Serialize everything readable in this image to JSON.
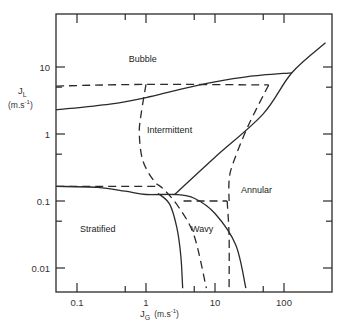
{
  "chart_data": {
    "type": "line",
    "title": "",
    "xlabel": "J_G (m.s^-1)",
    "ylabel": "J_L (m.s^-1)",
    "xscale": "log",
    "yscale": "log",
    "xlim": [
      0.05,
      400
    ],
    "ylim": [
      0.005,
      50
    ],
    "grid": false,
    "legend": null,
    "x_tick_labels": [
      "0.1",
      "1",
      "10",
      "100"
    ],
    "y_tick_labels": [
      "0.01",
      "0.1",
      "1",
      "10"
    ],
    "region_labels": [
      {
        "text": "Bubble",
        "x": 0.9,
        "y": 12
      },
      {
        "text": "Intermittent",
        "x": 2.2,
        "y": 1.05
      },
      {
        "text": "Annular",
        "x": 40,
        "y": 0.13
      },
      {
        "text": "Stratified",
        "x": 0.2,
        "y": 0.035
      },
      {
        "text": "Wavy",
        "x": 6.5,
        "y": 0.035
      }
    ],
    "series": [
      {
        "name": "solid: bubble/intermittent boundary",
        "style": "solid",
        "points": [
          [
            0.05,
            2.3
          ],
          [
            0.3,
            2.8
          ],
          [
            1,
            3.5
          ],
          [
            3,
            4.6
          ],
          [
            10,
            6.0
          ],
          [
            30,
            7.2
          ],
          [
            130,
            8.2
          ]
        ]
      },
      {
        "name": "solid: intermittent/annular boundary",
        "style": "solid",
        "points": [
          [
            2.6,
            0.125
          ],
          [
            10,
            0.45
          ],
          [
            50,
            2.0
          ],
          [
            130,
            8.2
          ],
          [
            400,
            23
          ]
        ]
      },
      {
        "name": "solid: stratified upper boundary",
        "style": "solid",
        "points": [
          [
            0.05,
            0.165
          ],
          [
            0.2,
            0.16
          ],
          [
            0.5,
            0.14
          ],
          [
            1,
            0.125
          ],
          [
            2.6,
            0.125
          ],
          [
            5,
            0.11
          ],
          [
            10,
            0.065
          ],
          [
            20,
            0.022
          ],
          [
            28,
            0.005
          ]
        ]
      },
      {
        "name": "solid: stratified/wavy boundary",
        "style": "solid",
        "points": [
          [
            1.5,
            0.13
          ],
          [
            2.2,
            0.09
          ],
          [
            2.8,
            0.04
          ],
          [
            3.2,
            0.015
          ],
          [
            3.4,
            0.005
          ]
        ]
      },
      {
        "name": "dashed: bubble upper boundary",
        "style": "dashed",
        "points": [
          [
            0.05,
            5.2
          ],
          [
            1,
            5.5
          ],
          [
            60,
            5.4
          ]
        ]
      },
      {
        "name": "dashed: intermittent/annular",
        "style": "dashed",
        "points": [
          [
            60,
            5.4
          ],
          [
            30,
            1.3
          ],
          [
            18,
            0.35
          ],
          [
            16,
            0.2
          ],
          [
            16,
            0.1
          ]
        ]
      },
      {
        "name": "dashed: intermittent left boundary",
        "style": "dashed",
        "points": [
          [
            1,
            5.5
          ],
          [
            0.85,
            2
          ],
          [
            0.8,
            1
          ],
          [
            0.9,
            0.4
          ],
          [
            1.3,
            0.2
          ],
          [
            1.8,
            0.15
          ],
          [
            3,
            0.08
          ],
          [
            5,
            0.03
          ],
          [
            7.5,
            0.005
          ]
        ]
      },
      {
        "name": "dashed: stratified horizontal",
        "style": "dashed",
        "points": [
          [
            0.05,
            0.165
          ],
          [
            1.6,
            0.165
          ]
        ]
      },
      {
        "name": "dashed: wavy top",
        "style": "dashed",
        "points": [
          [
            3.5,
            0.1
          ],
          [
            15,
            0.1
          ]
        ]
      },
      {
        "name": "dashed: wavy right vertical",
        "style": "dashed",
        "points": [
          [
            15,
            0.1
          ],
          [
            16,
            0.03
          ],
          [
            16,
            0.005
          ]
        ]
      }
    ]
  },
  "axes": {
    "x_label_main": "J",
    "x_label_sub": "G",
    "x_label_unit": "(m.s",
    "x_label_exp": "-1",
    "x_label_close": ")",
    "y_label_main": "J",
    "y_label_sub": "L",
    "y_label_unit": "(m.s",
    "y_label_exp": "-1",
    "y_label_close": ")"
  }
}
